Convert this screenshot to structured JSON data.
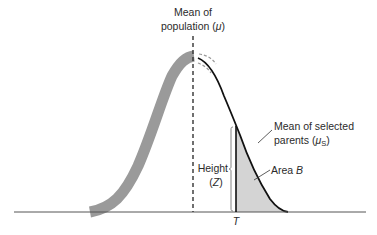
{
  "diagram": {
    "labels": {
      "mean_population_line1": "Mean of",
      "mean_population_line2_prefix": "population (",
      "mean_population_symbol": "μ",
      "mean_population_line2_suffix": ")",
      "mean_selected_line1": "Mean of selected",
      "mean_selected_line2_prefix": "parents (",
      "mean_selected_symbol": "μ",
      "mean_selected_subscript": "S",
      "mean_selected_line2_suffix": ")",
      "height_line1": "Height",
      "height_line2_prefix": "(",
      "height_symbol": "Z",
      "height_line2_suffix": ")",
      "area_prefix": "Area ",
      "area_symbol": "B",
      "threshold": "T"
    },
    "colors": {
      "population_band": "#9a9a9a",
      "selected_curve": "#111111",
      "shaded_area": "#d4d4d4",
      "baseline": "#555555",
      "mean_line": "#333333",
      "text": "#2b2b2b"
    },
    "geometry": {
      "baseline_y": 212,
      "baseline_x_start": 14,
      "baseline_x_end": 366,
      "mean_x": 193,
      "peak_y": 55,
      "threshold_x": 236
    }
  }
}
